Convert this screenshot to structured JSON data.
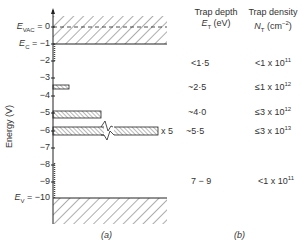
{
  "diagram": {
    "panel_a": {
      "caption": "(a)",
      "y_axis_label": "Energy (V)",
      "ticks": [
        {
          "value": 0,
          "label": "0",
          "prefix": "E",
          "sub": "VAC",
          "suffix": " = "
        },
        {
          "value": -1,
          "label": "−1",
          "prefix": "E",
          "sub": "C",
          "suffix": " = "
        },
        {
          "value": -2,
          "label": "−2"
        },
        {
          "value": -3,
          "label": "−3"
        },
        {
          "value": -4,
          "label": "−4"
        },
        {
          "value": -5,
          "label": "−5"
        },
        {
          "value": -6,
          "label": "−6"
        },
        {
          "value": -7,
          "label": "−7"
        },
        {
          "value": -8,
          "label": "−8"
        },
        {
          "value": -9,
          "label": "−9"
        },
        {
          "value": -10,
          "label": "−10",
          "prefix": "E",
          "sub": "V",
          "suffix": " = "
        }
      ],
      "bands": [
        {
          "name": "conduction-band",
          "from": 0.5,
          "to": -1
        },
        {
          "name": "valence-band",
          "from": -10,
          "to": -11.5
        }
      ],
      "trap_bars": [
        {
          "center": -3.5,
          "length_rel": 0.15
        },
        {
          "center": -5.2,
          "length_rel": 0.42
        },
        {
          "center": -6.2,
          "length_rel": 0.95,
          "broken": true,
          "multiplier": "x 5"
        }
      ]
    },
    "panel_b": {
      "caption": "(b)",
      "headers": {
        "depth_title": "Trap depth",
        "depth_symbol": "E",
        "depth_sub": "T",
        "depth_unit": " (eV)",
        "density_title": "Trap density",
        "density_symbol": "N",
        "density_sub": "T",
        "density_unit": " (cm",
        "density_exp": "−2",
        "density_close": ")"
      },
      "rows": [
        {
          "depth": "<1·5",
          "density_base": "<1 x 10",
          "density_exp": "11"
        },
        {
          "depth": "~2·5",
          "density_base": "≤1 x 10",
          "density_exp": "12"
        },
        {
          "depth": "~4·0",
          "density_base": "≤3 x 10",
          "density_exp": "12"
        },
        {
          "depth": "~5·5",
          "density_base": "≤3 x 10",
          "density_exp": "13"
        },
        {
          "depth": "7 − 9",
          "density_base": "<1 x 10",
          "density_exp": "11"
        }
      ]
    }
  }
}
